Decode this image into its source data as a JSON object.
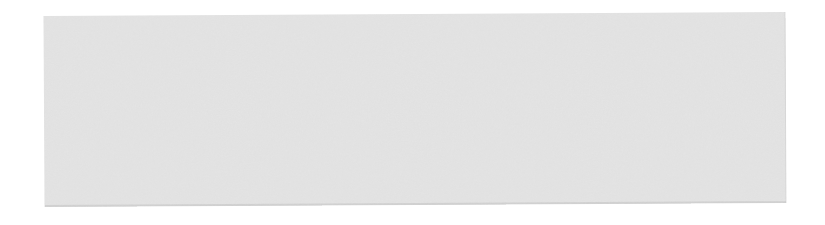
{
  "canvas": {
    "background_color": "#ffffff"
  },
  "panel": {
    "fill_color": "#e2e2e2",
    "grain_dark_color": "#c9c9c9",
    "grain_light_color": "#f2f2f2",
    "edge_shadow_color": "#cfcfcf",
    "content": ""
  }
}
